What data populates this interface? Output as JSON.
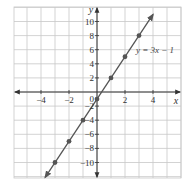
{
  "chart_data": {
    "type": "line",
    "title": "",
    "xlabel": "x",
    "ylabel": "y",
    "xlim": [
      -6,
      6
    ],
    "ylim": [
      -12,
      12
    ],
    "grid": true,
    "x_ticks": [
      -4,
      -2,
      2,
      4
    ],
    "x_tick_labels": [
      "−4",
      "−2",
      "2",
      "4"
    ],
    "y_ticks": [
      -10,
      -8,
      -6,
      -4,
      -2,
      2,
      4,
      6,
      8,
      10
    ],
    "y_tick_labels": [
      "−10",
      "−8",
      "−6",
      "−4",
      "−2",
      "2",
      "4",
      "6",
      "8",
      "10"
    ],
    "origin_label": "0",
    "series": [
      {
        "name": "y = 3x − 1",
        "equation": "y = 3x − 1",
        "slope": 3,
        "intercept": -1,
        "color": "#555555",
        "points": [
          {
            "x": -3,
            "y": -10
          },
          {
            "x": -2,
            "y": -7
          },
          {
            "x": -1,
            "y": -4
          },
          {
            "x": 0,
            "y": -1
          },
          {
            "x": 1,
            "y": 2
          },
          {
            "x": 2,
            "y": 5
          },
          {
            "x": 3,
            "y": 8
          }
        ]
      }
    ],
    "annotations": [
      {
        "text": "y = 3x − 1",
        "x": 4.5,
        "y": 6
      }
    ]
  }
}
